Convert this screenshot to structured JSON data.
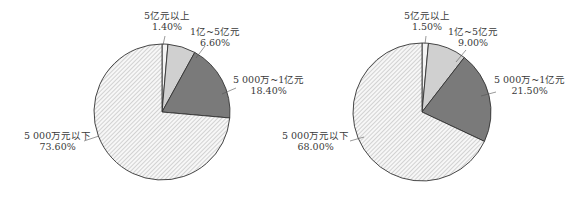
{
  "chart_data": [
    {
      "type": "pie",
      "title": "",
      "categories": [
        "5亿元以上",
        "1亿~5亿元",
        "5 000万~1亿元",
        "5 000万元以下"
      ],
      "values": [
        1.4,
        6.6,
        18.4,
        73.6
      ],
      "labels": [
        "1.40%",
        "6.60%",
        "18.40%",
        "73.60%"
      ],
      "fills": [
        "#f4f4f4",
        "#d0d0d0",
        "#7a7a7a",
        "hatch"
      ],
      "legend": "none"
    },
    {
      "type": "pie",
      "title": "",
      "categories": [
        "5亿元以上",
        "1亿~5亿元",
        "5 000万~1亿元",
        "5 000万元以下"
      ],
      "values": [
        1.5,
        9.0,
        21.5,
        68.0
      ],
      "labels": [
        "1.50%",
        "9.00%",
        "21.50%",
        "68.00%"
      ],
      "fills": [
        "#f4f4f4",
        "#d0d0d0",
        "#7a7a7a",
        "hatch"
      ],
      "legend": "none"
    }
  ]
}
